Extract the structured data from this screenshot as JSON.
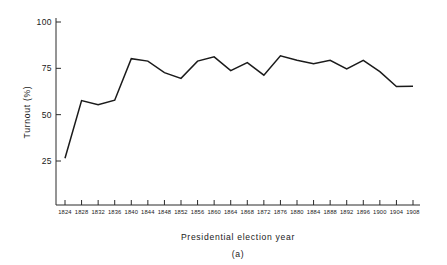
{
  "figure": {
    "caption": "(a)",
    "background_color": "#ffffff",
    "line_color": "#1b1b1b",
    "axis_color": "#2a2a2a"
  },
  "chart_data": {
    "type": "line",
    "title": "",
    "subtitle": "",
    "xlabel": "Presidential election year",
    "ylabel": "Turnout (%)",
    "categories": [
      "1824",
      "1828",
      "1832",
      "1836",
      "1840",
      "1844",
      "1848",
      "1852",
      "1856",
      "1860",
      "1864",
      "1868",
      "1872",
      "1876",
      "1880",
      "1884",
      "1888",
      "1892",
      "1896",
      "1900",
      "1904",
      "1908"
    ],
    "x": [
      1824,
      1828,
      1832,
      1836,
      1840,
      1844,
      1848,
      1852,
      1856,
      1860,
      1864,
      1868,
      1872,
      1876,
      1880,
      1884,
      1888,
      1892,
      1896,
      1900,
      1904,
      1908
    ],
    "values": [
      26.5,
      57.6,
      55.4,
      57.8,
      80.2,
      78.9,
      72.7,
      69.6,
      78.9,
      81.2,
      73.8,
      78.1,
      71.3,
      81.8,
      79.4,
      77.5,
      79.3,
      74.7,
      79.3,
      73.2,
      65.2,
      65.4
    ],
    "ylim": [
      0,
      110
    ],
    "yticks": [
      25,
      50,
      75,
      100
    ],
    "ytick_labels": [
      "25",
      "50",
      "75",
      "100"
    ],
    "xlim": [
      1822,
      1910
    ],
    "grid": false,
    "legend": null,
    "legend_position": "none",
    "annotations": []
  }
}
